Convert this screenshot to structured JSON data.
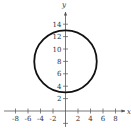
{
  "chart_data": {
    "type": "line",
    "title": "",
    "xlabel": "x",
    "ylabel": "y",
    "xlim": [
      -9,
      9.5
    ],
    "ylim": [
      -2.5,
      15.5
    ],
    "grid": false,
    "legend": null,
    "x_ticks": [
      -8,
      -6,
      -4,
      -2,
      2,
      4,
      6,
      8
    ],
    "x_tick_labels": [
      "-8",
      "-6",
      "-4",
      "-2",
      "2",
      "4",
      "6",
      "8"
    ],
    "y_ticks": [
      2,
      4,
      6,
      8,
      10,
      12,
      14
    ],
    "y_tick_labels": [
      "2",
      "4",
      "6",
      "8",
      "10",
      "12",
      "14"
    ],
    "series": [
      {
        "name": "circle",
        "shape": "circle",
        "center": [
          0,
          8
        ],
        "radius": 5,
        "equation": "x^2 + (y - 8)^2 = 25",
        "key_points": [
          [
            0,
            13
          ],
          [
            0,
            3
          ],
          [
            -5,
            8
          ],
          [
            5,
            8
          ]
        ],
        "color": "#111111"
      }
    ]
  },
  "colors": {
    "axis": "#555555",
    "curve": "#111111",
    "text": "#333333"
  }
}
